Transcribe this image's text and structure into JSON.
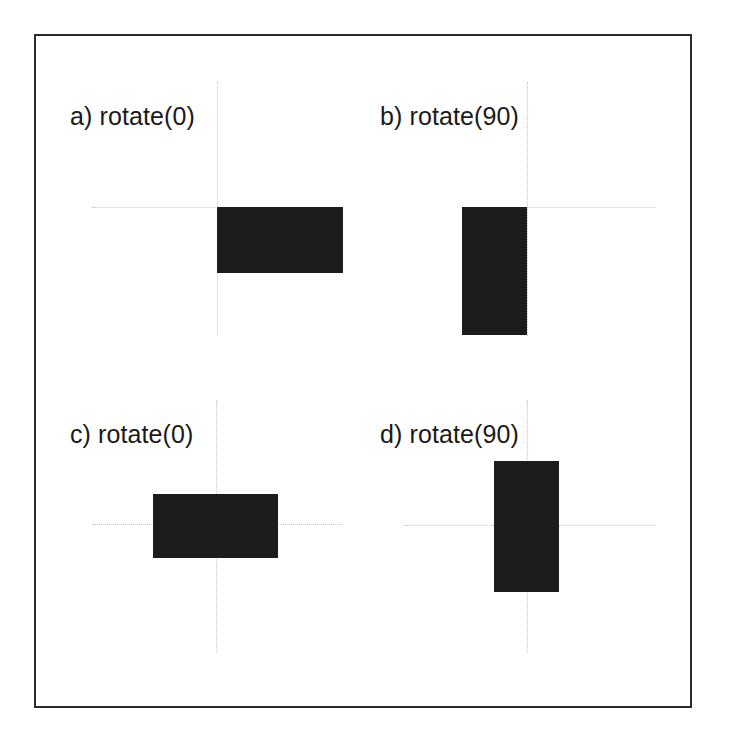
{
  "figure": {
    "type": "diagram",
    "background_color": "#ffffff",
    "frame_color": "#2b2b2b",
    "axis_color": "#c9c9c9",
    "shape_color": "#1c1c1c",
    "label_color": "#1a1a1a"
  },
  "panels": [
    {
      "id": "a",
      "label": "a) rotate(0)",
      "label_x": 70,
      "label_y": 104,
      "origin_x": 217,
      "origin_y": 207,
      "axis_v_top": 82,
      "axis_v_bottom": 336,
      "axis_h_left": 92,
      "axis_h_right": 218,
      "rect_x": 217,
      "rect_y": 207,
      "rect_w": 126,
      "rect_h": 66,
      "rect_anchor": "origin at top-left of rectangle"
    },
    {
      "id": "b",
      "label": "b) rotate(90)",
      "label_x": 380,
      "label_y": 104,
      "origin_x": 527,
      "origin_y": 207,
      "axis_v_top": 82,
      "axis_v_bottom": 336,
      "axis_h_left": 526,
      "axis_h_right": 656,
      "rect_x": 462,
      "rect_y": 207,
      "rect_w": 65,
      "rect_h": 128,
      "rect_anchor": "origin at top-right of rectangle"
    },
    {
      "id": "c",
      "label": "c) rotate(0)",
      "label_x": 70,
      "label_y": 422,
      "origin_x": 216,
      "origin_y": 524,
      "axis_v_top": 400,
      "axis_v_bottom": 652,
      "axis_h_left": 92,
      "axis_h_right": 342,
      "rect_x": 153,
      "rect_y": 494,
      "rect_w": 125,
      "rect_h": 64,
      "rect_anchor": "origin at center of rectangle"
    },
    {
      "id": "d",
      "label": "d) rotate(90)",
      "label_x": 380,
      "label_y": 422,
      "origin_x": 527,
      "origin_y": 525,
      "axis_v_top": 400,
      "axis_v_bottom": 652,
      "axis_h_left": 404,
      "axis_h_right": 656,
      "rect_x": 494,
      "rect_y": 461,
      "rect_w": 65,
      "rect_h": 131,
      "rect_anchor": "origin at center of rectangle"
    }
  ]
}
